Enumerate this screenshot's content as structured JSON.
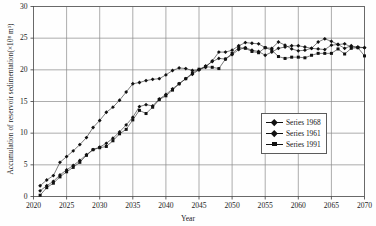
{
  "chart_data": {
    "type": "line",
    "title": "",
    "xlabel": "Year",
    "ylabel": "Accumulation of reservoir sedimentation(×10⁸ m³)",
    "xlim": [
      2020,
      2070
    ],
    "ylim": [
      0,
      30
    ],
    "xticks": [
      2020,
      2025,
      2030,
      2035,
      2040,
      2045,
      2050,
      2055,
      2060,
      2065,
      2070
    ],
    "yticks": [
      0,
      5,
      10,
      15,
      20,
      25,
      30
    ],
    "grid": "both",
    "legend_position": "center-right",
    "x": [
      2021,
      2022,
      2023,
      2024,
      2025,
      2026,
      2027,
      2028,
      2029,
      2030,
      2031,
      2032,
      2033,
      2034,
      2035,
      2036,
      2037,
      2038,
      2039,
      2040,
      2041,
      2042,
      2043,
      2044,
      2045,
      2046,
      2047,
      2048,
      2049,
      2050,
      2051,
      2052,
      2053,
      2054,
      2055,
      2056,
      2057,
      2058,
      2059,
      2060,
      2061,
      2062,
      2063,
      2064,
      2065,
      2066,
      2067,
      2068,
      2069,
      2070
    ],
    "series": [
      {
        "name": "Series 1968",
        "marker": "diamond",
        "color": "#111111",
        "values": [
          1.7,
          2.6,
          3.3,
          5.4,
          6.3,
          7.2,
          8.2,
          9.3,
          10.9,
          12.0,
          13.3,
          14.1,
          15.2,
          16.5,
          17.8,
          18.0,
          18.3,
          18.5,
          18.6,
          19.2,
          19.9,
          20.3,
          20.2,
          19.9,
          20.0,
          20.4,
          21.4,
          22.8,
          22.8,
          23.1,
          23.8,
          24.3,
          24.2,
          24.1,
          23.5,
          23.4,
          24.4,
          23.9,
          23.3,
          23.0,
          23.1,
          23.4,
          24.4,
          24.9,
          24.5,
          24.0,
          24.1,
          23.6,
          23.6,
          23.5
        ]
      },
      {
        "name": "Series 1961",
        "marker": "diamond",
        "color": "#111111",
        "values": [
          0.9,
          1.7,
          2.4,
          3.4,
          4.2,
          4.9,
          5.7,
          6.6,
          7.4,
          7.8,
          8.4,
          9.2,
          10.2,
          11.3,
          12.5,
          14.2,
          14.5,
          14.3,
          15.4,
          16.1,
          17.0,
          17.8,
          18.6,
          19.3,
          20.0,
          20.6,
          21.3,
          21.8,
          21.7,
          22.4,
          23.2,
          23.5,
          23.1,
          22.9,
          22.3,
          22.8,
          23.4,
          23.6,
          23.8,
          23.8,
          23.6,
          23.4,
          23.3,
          23.2,
          23.9,
          24.0,
          23.4,
          23.8,
          23.5,
          23.5
        ]
      },
      {
        "name": "Series 1991",
        "marker": "square",
        "color": "#111111",
        "values": [
          0.2,
          1.4,
          2.1,
          3.1,
          3.9,
          4.6,
          5.4,
          6.5,
          7.4,
          7.7,
          7.9,
          8.8,
          9.9,
          10.6,
          12.1,
          13.6,
          13.1,
          14.1,
          15.3,
          15.9,
          16.8,
          17.8,
          18.6,
          19.5,
          20.1,
          20.5,
          20.4,
          20.2,
          21.7,
          22.6,
          23.5,
          23.4,
          22.9,
          22.7,
          23.5,
          23.1,
          22.1,
          21.8,
          22.0,
          22.0,
          21.9,
          22.3,
          22.6,
          22.6,
          22.6,
          23.3,
          22.5,
          23.4,
          23.5,
          22.2
        ]
      }
    ],
    "legend": [
      {
        "label": "Series 1968",
        "marker": "diamond"
      },
      {
        "label": "Series 1961",
        "marker": "diamond"
      },
      {
        "label": "Series 1991",
        "marker": "square"
      }
    ]
  }
}
